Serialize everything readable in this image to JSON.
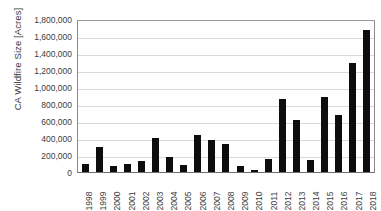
{
  "chart_data": {
    "type": "bar",
    "title": "",
    "xlabel": "",
    "ylabel": "CA Wildfire Size [Acres]",
    "ylim": [
      0,
      1800000
    ],
    "ytick_step": 200000,
    "grid": true,
    "legend": "none",
    "bar_color": "#0d0d0d",
    "gridline_color": "#d9d9d9",
    "axis_color": "#808080",
    "ytick_labels": [
      "1,800,000",
      "1,600,000",
      "1,400,000",
      "1,200,000",
      "1,000,000",
      "800,000",
      "600,000",
      "400,000",
      "200,000",
      "0"
    ],
    "categories": [
      "1998",
      "1999",
      "2000",
      "2001",
      "2002",
      "2003",
      "2004",
      "2005",
      "2006",
      "2007",
      "2008",
      "2009",
      "2010",
      "2011",
      "2012",
      "2013",
      "2014",
      "2015",
      "2016",
      "2017",
      "2018"
    ],
    "values": [
      95000,
      290000,
      70000,
      95000,
      125000,
      405000,
      180000,
      80000,
      440000,
      380000,
      330000,
      65000,
      20000,
      150000,
      855000,
      610000,
      140000,
      880000,
      670000,
      1280000,
      1670000
    ]
  }
}
